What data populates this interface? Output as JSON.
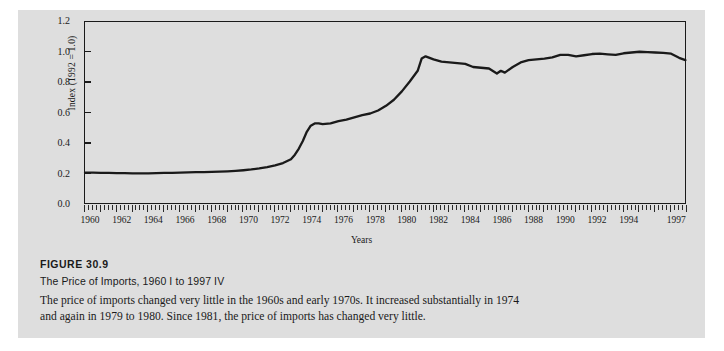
{
  "figure": {
    "number_label": "FIGURE 30.9",
    "subtitle": "The Price of Imports, 1960 I to 1997 IV",
    "body_text": "The price of imports changed very little in the 1960s and early 1970s. It increased substantially in 1974 and again in 1979 to 1980. Since 1981, the price of imports has changed very little."
  },
  "chart_data": {
    "type": "line",
    "title": "The Price of Imports, 1960 I to 1997 IV",
    "xlabel": "Years",
    "ylabel": "Index (1992 = 1.0)",
    "ylim": [
      0.0,
      1.2
    ],
    "xlim": [
      1960,
      1998
    ],
    "grid": false,
    "legend": null,
    "ytick_labels": [
      "1.2",
      "1.0",
      "0.8",
      "0.6",
      "0.4",
      "0.2",
      "0.0"
    ],
    "ytick_values": [
      1.2,
      1.0,
      0.8,
      0.6,
      0.4,
      0.2,
      0.0
    ],
    "xtick_labels": [
      "1960",
      "1962",
      "1964",
      "1966",
      "1968",
      "1970",
      "1972",
      "1974",
      "1976",
      "1978",
      "1980",
      "1982",
      "1984",
      "1986",
      "1988",
      "1990",
      "1992",
      "1994",
      "1997"
    ],
    "xtick_values": [
      1960,
      1962,
      1964,
      1966,
      1968,
      1970,
      1972,
      1974,
      1976,
      1978,
      1980,
      1982,
      1984,
      1986,
      1988,
      1990,
      1992,
      1994,
      1997
    ],
    "minor_tick_interval_years": 0.25,
    "line_color": "#1a1a1a",
    "line_width_px": 2.3,
    "series": [
      {
        "name": "Price of imports index (1992 = 1.0)",
        "x": [
          1960.0,
          1960.5,
          1961.0,
          1961.5,
          1962.0,
          1962.5,
          1963.0,
          1963.5,
          1964.0,
          1964.5,
          1965.0,
          1965.5,
          1966.0,
          1966.5,
          1967.0,
          1967.5,
          1968.0,
          1968.5,
          1969.0,
          1969.5,
          1970.0,
          1970.5,
          1971.0,
          1971.5,
          1972.0,
          1972.5,
          1973.0,
          1973.25,
          1973.5,
          1973.75,
          1974.0,
          1974.25,
          1974.5,
          1974.75,
          1975.0,
          1975.5,
          1976.0,
          1976.5,
          1977.0,
          1977.5,
          1978.0,
          1978.5,
          1979.0,
          1979.5,
          1980.0,
          1980.5,
          1981.0,
          1981.25,
          1981.5,
          1982.0,
          1982.5,
          1983.0,
          1983.5,
          1984.0,
          1984.5,
          1985.0,
          1985.5,
          1986.0,
          1986.25,
          1986.5,
          1987.0,
          1987.5,
          1988.0,
          1988.5,
          1989.0,
          1989.5,
          1990.0,
          1990.5,
          1991.0,
          1991.5,
          1992.0,
          1992.5,
          1993.0,
          1993.5,
          1994.0,
          1994.5,
          1995.0,
          1995.5,
          1996.0,
          1996.5,
          1997.0,
          1997.5,
          1997.9
        ],
        "values": [
          0.212,
          0.212,
          0.211,
          0.21,
          0.209,
          0.209,
          0.208,
          0.208,
          0.208,
          0.209,
          0.21,
          0.211,
          0.212,
          0.214,
          0.215,
          0.216,
          0.217,
          0.219,
          0.221,
          0.224,
          0.228,
          0.233,
          0.24,
          0.249,
          0.26,
          0.275,
          0.3,
          0.33,
          0.37,
          0.42,
          0.48,
          0.52,
          0.535,
          0.535,
          0.53,
          0.535,
          0.55,
          0.56,
          0.575,
          0.59,
          0.6,
          0.62,
          0.65,
          0.69,
          0.745,
          0.81,
          0.88,
          0.96,
          0.975,
          0.955,
          0.94,
          0.935,
          0.93,
          0.925,
          0.905,
          0.9,
          0.895,
          0.862,
          0.88,
          0.868,
          0.905,
          0.935,
          0.95,
          0.955,
          0.96,
          0.968,
          0.985,
          0.985,
          0.975,
          0.982,
          0.99,
          0.992,
          0.988,
          0.985,
          0.995,
          1.0,
          1.005,
          1.002,
          1.0,
          0.998,
          0.992,
          0.965,
          0.95
        ]
      }
    ],
    "annotations": []
  }
}
